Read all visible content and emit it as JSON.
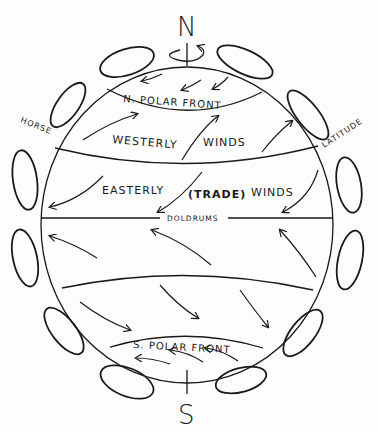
{
  "diagram": {
    "poles": {
      "north": "N",
      "south": "S"
    },
    "zones": {
      "north_polar_front": "N. POLAR FRONT",
      "westerly_winds_a": "WESTERLY",
      "westerly_winds_b": "WINDS",
      "easterly_a": "EASTERLY",
      "easterly_trade": "(TRADE)",
      "easterly_b": "WINDS",
      "doldrums": "DOLDRUMS",
      "south_polar_front": "S. POLAR FRONT"
    },
    "side_labels": {
      "left": "HORSE",
      "right": "LATITUDE"
    },
    "colors": {
      "ink": "#1a1a1a",
      "paper": "#fdfdfd"
    }
  }
}
